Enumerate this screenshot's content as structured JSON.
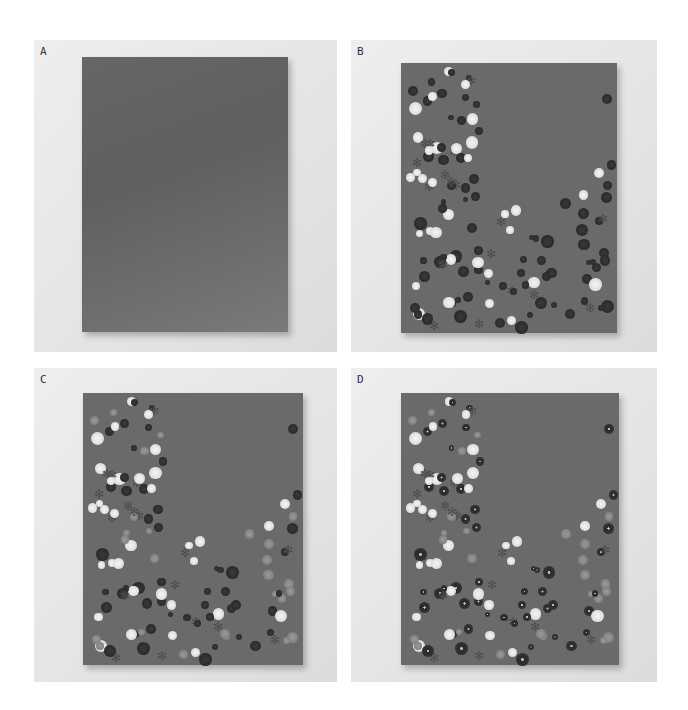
{
  "figure": {
    "panels": [
      {
        "id": "A",
        "label": "A",
        "description": "Plain grey painted board, no dots"
      },
      {
        "id": "B",
        "label": "B",
        "description": "Board with white and dark dots plus star shapes, empty upper-right region"
      },
      {
        "id": "C",
        "label": "C",
        "description": "Board with additional grey ring dots added"
      },
      {
        "id": "D",
        "label": "D",
        "description": "Board with center highlights added to dark dots"
      }
    ]
  },
  "colors": {
    "background": "#ffffff",
    "panel_backdrop": "#e6e6e6",
    "board": "#6a6a6a",
    "light_dot": "#e8e8e8",
    "dark_dot": "#2e2e2e",
    "grey_dot": "#8c8c8c"
  }
}
